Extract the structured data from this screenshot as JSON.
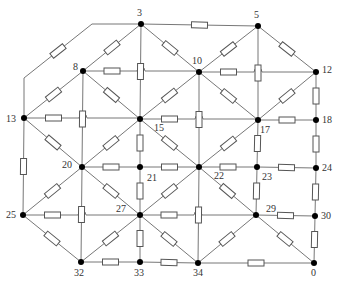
{
  "diagram": {
    "type": "resistor-network",
    "colors": {
      "wire": "#777777",
      "resistor_stroke": "#555555",
      "node": "#000000",
      "label": "#333333",
      "background": "#ffffff"
    },
    "nodes": [
      {
        "id": "3",
        "x": 141,
        "y": 24,
        "lx": 137,
        "ly": 16
      },
      {
        "id": "5",
        "x": 258,
        "y": 26,
        "lx": 254,
        "ly": 18
      },
      {
        "id": "8",
        "x": 83,
        "y": 71,
        "lx": 73,
        "ly": 70
      },
      {
        "id": "10",
        "x": 199,
        "y": 72,
        "lx": 192,
        "ly": 64
      },
      {
        "id": "12",
        "x": 316,
        "y": 72,
        "lx": 322,
        "ly": 73
      },
      {
        "id": "13",
        "x": 24,
        "y": 118,
        "lx": 6,
        "ly": 122
      },
      {
        "id": "15",
        "x": 140,
        "y": 119,
        "lx": 154,
        "ly": 131
      },
      {
        "id": "17",
        "x": 258,
        "y": 120,
        "lx": 260,
        "ly": 133
      },
      {
        "id": "18",
        "x": 316,
        "y": 120,
        "lx": 322,
        "ly": 123
      },
      {
        "id": "20",
        "x": 82,
        "y": 167,
        "lx": 62,
        "ly": 168
      },
      {
        "id": "21",
        "x": 140,
        "y": 167,
        "lx": 147,
        "ly": 181
      },
      {
        "id": "22",
        "x": 199,
        "y": 167,
        "lx": 214,
        "ly": 179
      },
      {
        "id": "23",
        "x": 257,
        "y": 167,
        "lx": 262,
        "ly": 180
      },
      {
        "id": "24",
        "x": 316,
        "y": 168,
        "lx": 322,
        "ly": 171
      },
      {
        "id": "25",
        "x": 23,
        "y": 215,
        "lx": 6,
        "ly": 218
      },
      {
        "id": "27",
        "x": 140,
        "y": 215,
        "lx": 116,
        "ly": 212
      },
      {
        "id": "29",
        "x": 256,
        "y": 215,
        "lx": 266,
        "ly": 212
      },
      {
        "id": "30",
        "x": 315,
        "y": 216,
        "lx": 321,
        "ly": 219
      },
      {
        "id": "32",
        "x": 81,
        "y": 262,
        "lx": 74,
        "ly": 276
      },
      {
        "id": "33",
        "x": 140,
        "y": 262,
        "lx": 134,
        "ly": 276
      },
      {
        "id": "34",
        "x": 198,
        "y": 263,
        "lx": 193,
        "ly": 276
      },
      {
        "id": "0",
        "x": 314,
        "y": 263,
        "lx": 311,
        "ly": 276
      }
    ],
    "edges": [
      {
        "from": "3",
        "to": "5",
        "resistor": true
      },
      {
        "from": "3",
        "to": "8",
        "resistor": true
      },
      {
        "from": "3",
        "to": "10",
        "resistor": true
      },
      {
        "from": "3",
        "to": "15",
        "resistor": true
      },
      {
        "from": "5",
        "to": "10",
        "resistor": true
      },
      {
        "from": "5",
        "to": "12",
        "resistor": true
      },
      {
        "from": "5",
        "to": "17",
        "resistor": true
      },
      {
        "from": "8",
        "to": "10",
        "resistor": true,
        "hop_at": [
          141
        ]
      },
      {
        "from": "8",
        "to": "13",
        "resistor": true
      },
      {
        "from": "8",
        "to": "15",
        "resistor": true
      },
      {
        "from": "8",
        "to": "20",
        "resistor": true
      },
      {
        "from": "10",
        "to": "12",
        "resistor": true,
        "hop_at": [
          258
        ]
      },
      {
        "from": "10",
        "to": "15",
        "resistor": true
      },
      {
        "from": "10",
        "to": "17",
        "resistor": true
      },
      {
        "from": "10",
        "to": "22",
        "resistor": true
      },
      {
        "from": "12",
        "to": "17",
        "resistor": true
      },
      {
        "from": "12",
        "to": "18",
        "resistor": true
      },
      {
        "from": "13",
        "to": "15",
        "resistor": true,
        "hop_at": [
          83
        ]
      },
      {
        "from": "13",
        "to": "20",
        "resistor": true
      },
      {
        "from": "13",
        "to": "25",
        "resistor": true
      },
      {
        "from": "15",
        "to": "17",
        "resistor": true,
        "hop_at": [
          199
        ]
      },
      {
        "from": "15",
        "to": "20",
        "resistor": true
      },
      {
        "from": "15",
        "to": "21",
        "resistor": true
      },
      {
        "from": "15",
        "to": "22",
        "resistor": true
      },
      {
        "from": "17",
        "to": "18",
        "resistor": true
      },
      {
        "from": "17",
        "to": "22",
        "resistor": true
      },
      {
        "from": "17",
        "to": "23",
        "resistor": true
      },
      {
        "from": "18",
        "to": "24",
        "resistor": true
      },
      {
        "from": "20",
        "to": "21",
        "resistor": true
      },
      {
        "from": "20",
        "to": "25",
        "resistor": true
      },
      {
        "from": "20",
        "to": "27",
        "resistor": true
      },
      {
        "from": "20",
        "to": "32",
        "resistor": true
      },
      {
        "from": "21",
        "to": "22",
        "resistor": true
      },
      {
        "from": "21",
        "to": "27",
        "resistor": true
      },
      {
        "from": "22",
        "to": "23",
        "resistor": true
      },
      {
        "from": "22",
        "to": "27",
        "resistor": true
      },
      {
        "from": "22",
        "to": "29",
        "resistor": true
      },
      {
        "from": "22",
        "to": "34",
        "resistor": true
      },
      {
        "from": "23",
        "to": "24",
        "resistor": true
      },
      {
        "from": "23",
        "to": "29",
        "resistor": true
      },
      {
        "from": "24",
        "to": "30",
        "resistor": true
      },
      {
        "from": "25",
        "to": "27",
        "resistor": true,
        "hop_at": [
          82
        ]
      },
      {
        "from": "25",
        "to": "32",
        "resistor": true
      },
      {
        "from": "27",
        "to": "29",
        "resistor": true,
        "hop_at": [
          198
        ]
      },
      {
        "from": "27",
        "to": "32",
        "resistor": true
      },
      {
        "from": "27",
        "to": "33",
        "resistor": true
      },
      {
        "from": "27",
        "to": "34",
        "resistor": true
      },
      {
        "from": "29",
        "to": "30",
        "resistor": true
      },
      {
        "from": "29",
        "to": "34",
        "resistor": true
      },
      {
        "from": "29",
        "to": "0",
        "resistor": true
      },
      {
        "from": "30",
        "to": "0",
        "resistor": true
      },
      {
        "from": "32",
        "to": "33",
        "resistor": true
      },
      {
        "from": "33",
        "to": "34",
        "resistor": true
      },
      {
        "from": "34",
        "to": "0",
        "resistor": true
      }
    ],
    "outer_path": {
      "from": "13",
      "to": "3",
      "points": [
        [
          24,
          118
        ],
        [
          24,
          78
        ],
        [
          92,
          24
        ],
        [
          141,
          24
        ]
      ],
      "resistor_segment": 1
    }
  }
}
